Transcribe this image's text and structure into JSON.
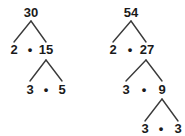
{
  "figure": {
    "kind": "factor-tree-diagram",
    "background_color": "#ffffff",
    "ink_color": "#1a1a1a",
    "multiplication_symbol": "•"
  },
  "trees": [
    {
      "name": "factor-tree-30",
      "root": "30",
      "rows": [
        {
          "name": "row-root",
          "cells": [
            "30"
          ]
        },
        {
          "name": "row-level-1",
          "cells": [
            "2",
            "15"
          ]
        },
        {
          "name": "row-level-2",
          "cells": [
            "3",
            "5"
          ]
        }
      ],
      "nodes": {
        "root": "30",
        "left_1": "2",
        "right_1": "15",
        "left_2": "3",
        "right_2": "5"
      },
      "operators": [
        "•",
        "•"
      ]
    },
    {
      "name": "factor-tree-54",
      "root": "54",
      "rows": [
        {
          "name": "row-root",
          "cells": [
            "54"
          ]
        },
        {
          "name": "row-level-1",
          "cells": [
            "2",
            "27"
          ]
        },
        {
          "name": "row-level-2",
          "cells": [
            "3",
            "9"
          ]
        },
        {
          "name": "row-level-3",
          "cells": [
            "3",
            "3"
          ]
        }
      ],
      "nodes": {
        "root": "54",
        "left_1": "2",
        "right_1": "27",
        "left_2": "3",
        "right_2": "9",
        "left_3": "3",
        "right_3": "3"
      },
      "operators": [
        "•",
        "•",
        "•"
      ]
    }
  ]
}
